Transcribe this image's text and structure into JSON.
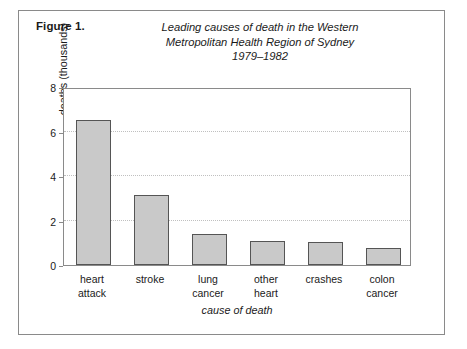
{
  "caption": {
    "figure_number": "Figure 1.",
    "title_lines": [
      "Leading causes of death in the Western",
      "Metropolitan Health Region of Sydney",
      "1979–1982"
    ]
  },
  "chart_data": {
    "type": "bar",
    "title": "Leading causes of death in the Western Metropolitan Health Region of Sydney 1979–1982",
    "xlabel": "cause of death",
    "ylabel": "deaths (thousands)",
    "categories": [
      "heart attack",
      "stroke",
      "lung cancer",
      "other heart",
      "crashes",
      "colon cancer"
    ],
    "category_label_lines": [
      [
        "heart",
        "attack"
      ],
      [
        "stroke"
      ],
      [
        "lung",
        "cancer"
      ],
      [
        "other",
        "heart"
      ],
      [
        "crashes"
      ],
      [
        "colon",
        "cancer"
      ]
    ],
    "values": [
      6.5,
      3.15,
      1.4,
      1.1,
      1.05,
      0.75
    ],
    "ylim": [
      0,
      8
    ],
    "ytick_labels": [
      "0",
      "2",
      "4",
      "6",
      "8"
    ],
    "ytick_values": [
      0,
      2,
      4,
      6,
      8
    ],
    "gridlines_at": [
      2,
      4,
      6
    ],
    "grid": true,
    "legend": "none",
    "bar_fill_color": "#c9c9c9",
    "bar_edge_color": "#555555",
    "axis_color": "#8a8a8a",
    "grid_color": "#c0c0c0"
  }
}
